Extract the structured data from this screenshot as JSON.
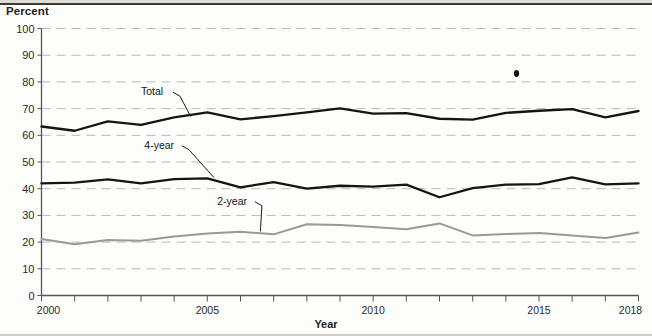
{
  "chart_data": {
    "type": "line",
    "title": "",
    "xlabel": "Year",
    "ylabel": "Percent",
    "ylim": [
      0,
      100
    ],
    "xlim": [
      2000,
      2018
    ],
    "grid": true,
    "legend_position": "inline-annotations",
    "yticks": [
      0,
      10,
      20,
      30,
      40,
      50,
      60,
      70,
      80,
      90,
      100
    ],
    "xticks": [
      2000,
      2005,
      2010,
      2015,
      2018
    ],
    "xtick_labels": [
      "2000",
      "2005",
      "2010",
      "2015",
      "2018"
    ],
    "x": [
      2000,
      2001,
      2002,
      2003,
      2004,
      2005,
      2006,
      2007,
      2008,
      2009,
      2010,
      2011,
      2012,
      2013,
      2014,
      2015,
      2016,
      2017,
      2018
    ],
    "series": [
      {
        "name": "Total",
        "color": "#141414",
        "values": [
          63.3,
          61.7,
          65.2,
          63.9,
          66.7,
          68.6,
          66.0,
          67.2,
          68.6,
          70.1,
          68.1,
          68.3,
          66.2,
          65.9,
          68.4,
          69.2,
          69.8,
          66.7,
          69.1
        ]
      },
      {
        "name": "4-year",
        "color": "#141414",
        "values": [
          42.0,
          42.3,
          43.5,
          42.0,
          43.6,
          43.9,
          40.5,
          42.5,
          40.0,
          41.1,
          40.8,
          41.5,
          36.8,
          40.2,
          41.5,
          41.7,
          44.2,
          41.6,
          42.0
        ]
      },
      {
        "name": "2-year",
        "color": "#999999",
        "values": [
          21.2,
          19.2,
          20.8,
          20.5,
          22.1,
          23.2,
          23.9,
          22.9,
          26.7,
          26.4,
          25.7,
          24.8,
          27.0,
          22.5,
          23.0,
          23.4,
          22.5,
          21.5,
          23.6
        ]
      }
    ],
    "annotations": [
      {
        "text": "Total",
        "label_x": 2003.0,
        "label_y": 75.0,
        "point_x": 2004.5,
        "point_y": 67.0
      },
      {
        "text": "4-year",
        "label_x": 2003.1,
        "label_y": 55.0,
        "point_x": 2005.2,
        "point_y": 44.2
      },
      {
        "text": "2-year",
        "label_x": 2005.3,
        "label_y": 34.0,
        "point_x": 2006.6,
        "point_y": 24.0
      }
    ]
  },
  "labels": {
    "y_axis_title": "Percent",
    "x_axis_title": "Year"
  }
}
